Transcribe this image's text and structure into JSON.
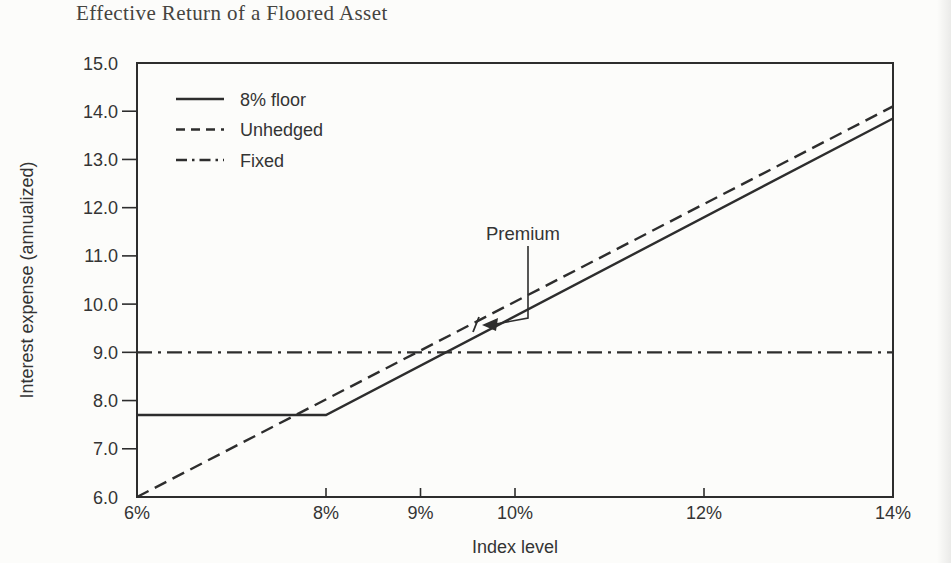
{
  "figure": {
    "title": "Effective Return of a Floored Asset"
  },
  "chart_data": {
    "type": "line",
    "title": "Effective Return of a Floored Asset",
    "xlabel": "Index level",
    "ylabel": "Interest expense (annualized)",
    "xlim": [
      6,
      14
    ],
    "ylim": [
      6,
      15
    ],
    "x_tick_values": [
      6,
      8,
      9,
      10,
      12,
      14
    ],
    "x_tick_labels": [
      "6%",
      "8%",
      "9%",
      "10%",
      "12%",
      "14%"
    ],
    "y_tick_values": [
      6,
      7,
      8,
      9,
      10,
      11,
      12,
      13,
      14,
      15
    ],
    "y_tick_labels": [
      "6.0",
      "7.0",
      "8.0",
      "9.0",
      "10.0",
      "11.0",
      "12.0",
      "13.0",
      "14.0",
      "15.0"
    ],
    "grid": false,
    "line_color": "#2d2d2d",
    "legend": {
      "position": "top-left",
      "entries": [
        {
          "label": "8% floor",
          "style": "solid"
        },
        {
          "label": "Unhedged",
          "style": "dashed"
        },
        {
          "label": "Fixed",
          "style": "dashdot"
        }
      ]
    },
    "series": [
      {
        "name": "Fixed",
        "style": "dashdot",
        "points": [
          [
            6,
            9.0
          ],
          [
            14,
            9.0
          ]
        ]
      },
      {
        "name": "Unhedged",
        "style": "dashed",
        "points": [
          [
            6,
            6.0
          ],
          [
            14,
            14.1
          ]
        ]
      },
      {
        "name": "8% floor",
        "style": "solid",
        "points": [
          [
            6,
            7.7
          ],
          [
            8,
            7.7
          ],
          [
            14,
            13.85
          ]
        ]
      }
    ],
    "annotation": {
      "label": "Premium",
      "description": "arrow pointing at the vertical gap between the Unhedged and 8% floor lines near index 9.7%"
    }
  }
}
